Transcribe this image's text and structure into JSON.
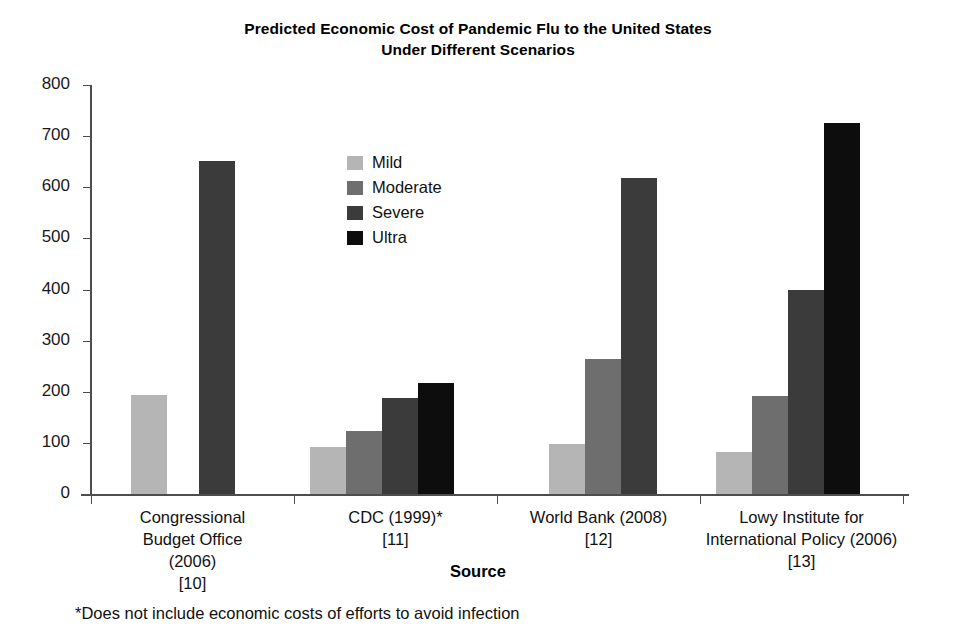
{
  "chart_data": {
    "type": "bar",
    "title": "Predicted Economic Cost of Pandemic Flu to the United States Under Different Scenarios",
    "title_line1": "Predicted Economic Cost of Pandemic Flu to the United States",
    "title_line2": "Under Different Scenarios",
    "xlabel": "Source",
    "ylabel": "",
    "ylim": [
      0,
      800
    ],
    "ytick_values": [
      0,
      100,
      200,
      300,
      400,
      500,
      600,
      700,
      800
    ],
    "ytick_labels": [
      "0",
      "100",
      "200",
      "300",
      "400",
      "500",
      "600",
      "700",
      "800"
    ],
    "grid": false,
    "legend_position": "inside-upper-center",
    "categories": [
      "Congressional Budget Office (2006) [10]",
      "CDC (1999)* [11]",
      "World Bank (2008) [12]",
      "Lowy Institute for International Policy (2006) [13]"
    ],
    "category_label_lines": [
      [
        "Congressional",
        "Budget Office",
        "(2006)",
        "[10]"
      ],
      [
        "CDC (1999)*",
        "[11]"
      ],
      [
        "World Bank (2008)",
        "[12]"
      ],
      [
        "Lowy Institute for",
        "International Policy (2006)",
        "[13]"
      ]
    ],
    "series": [
      {
        "name": "Mild",
        "color": "#b5b5b5",
        "values": [
          193,
          92,
          98,
          83
        ]
      },
      {
        "name": "Moderate",
        "color": "#6e6e6e",
        "values": [
          null,
          124,
          264,
          191
        ]
      },
      {
        "name": "Severe",
        "color": "#3b3b3b",
        "values": [
          652,
          188,
          618,
          399
        ]
      },
      {
        "name": "Ultra",
        "color": "#0d0d0d",
        "values": [
          null,
          218,
          null,
          725
        ]
      }
    ],
    "annotations": [
      "*Does not include economic costs of efforts to avoid infection"
    ]
  },
  "legend": {
    "items": [
      {
        "label": "Mild"
      },
      {
        "label": "Moderate"
      },
      {
        "label": "Severe"
      },
      {
        "label": "Ultra"
      }
    ]
  },
  "footnote": "*Does not include economic costs of efforts to avoid infection"
}
